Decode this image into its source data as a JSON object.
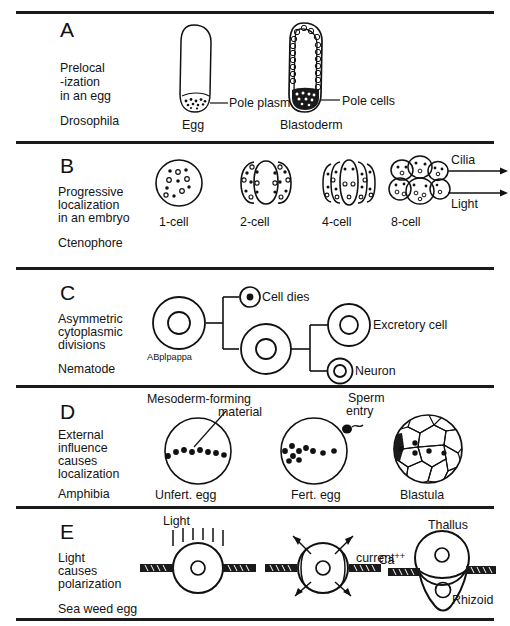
{
  "figure": {
    "ink_color": "#111111",
    "background": "#ffffff",
    "panel_count": 5
  },
  "panels": [
    {
      "letter": "A",
      "description_lines": [
        "Prelocal",
        "-ization",
        "in an egg"
      ],
      "organism": "Drosophila",
      "stages": [
        {
          "caption": "Egg",
          "annotation": "Pole plasm"
        },
        {
          "caption": "Blastoderm",
          "annotation": "Pole cells"
        }
      ]
    },
    {
      "letter": "B",
      "description_lines": [
        "Progressive",
        "localization",
        "in an embryo"
      ],
      "organism": "Ctenophore",
      "stages": [
        {
          "caption": "1-cell"
        },
        {
          "caption": "2-cell"
        },
        {
          "caption": "4-cell"
        },
        {
          "caption": "8-cell"
        }
      ],
      "arrows": [
        "Cilia",
        "Light"
      ]
    },
    {
      "letter": "C",
      "description_lines": [
        "Asymmetric",
        "cytoplasmic",
        "divisions"
      ],
      "organism": "Nematode",
      "founder_cell": "ABplpappa",
      "fates": [
        "Cell dies",
        "Excretory cell",
        "Neuron"
      ]
    },
    {
      "letter": "D",
      "description_lines": [
        "External",
        "influence",
        "causes",
        "localization"
      ],
      "organism": "Amphibia",
      "annotations": [
        "Mesoderm-forming",
        "material",
        "Sperm",
        "entry"
      ],
      "stages": [
        {
          "caption": "Unfert. egg"
        },
        {
          "caption": "Fert. egg"
        },
        {
          "caption": "Blastula"
        }
      ]
    },
    {
      "letter": "E",
      "description_lines": [
        "Light",
        "causes",
        "polarization"
      ],
      "organism": "Sea weed egg",
      "annotations": [
        "Light",
        "Ca",
        "++",
        "current",
        "Thallus",
        "Rhizoid"
      ]
    }
  ]
}
